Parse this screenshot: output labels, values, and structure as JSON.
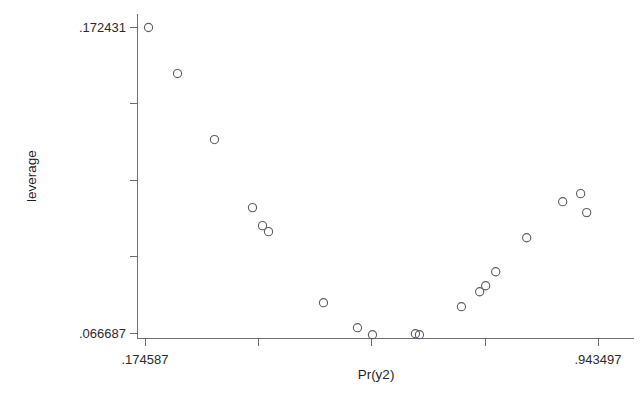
{
  "chart_data": {
    "type": "scatter",
    "title": "",
    "subtitle": "",
    "xlabel": "Pr(y2)",
    "ylabel": "leverage",
    "grid": false,
    "legend": null,
    "xlim": [
      0.174587,
      0.943497
    ],
    "ylim": [
      0.066687,
      0.172431
    ],
    "xtick_labels": [
      ".174587",
      ".943497"
    ],
    "ytick_labels": [
      ".172431",
      ".066687"
    ],
    "xticks_count": 5,
    "yticks_count": 5,
    "marker": "open-circle",
    "marker_color": "#5c5c6a",
    "n_points": 19,
    "points": [
      {
        "x": 0.1797,
        "y": 0.17243
      },
      {
        "x": 0.2289,
        "y": 0.15652
      },
      {
        "x": 0.2917,
        "y": 0.1337
      },
      {
        "x": 0.3562,
        "y": 0.11019
      },
      {
        "x": 0.3732,
        "y": 0.10396
      },
      {
        "x": 0.3834,
        "y": 0.10189
      },
      {
        "x": 0.4767,
        "y": 0.07733
      },
      {
        "x": 0.5344,
        "y": 0.06869
      },
      {
        "x": 0.5598,
        "y": 0.06628
      },
      {
        "x": 0.6328,
        "y": 0.06662
      },
      {
        "x": 0.6396,
        "y": 0.06628
      },
      {
        "x": 0.7108,
        "y": 0.07595
      },
      {
        "x": 0.7418,
        "y": 0.08112
      },
      {
        "x": 0.752,
        "y": 0.08319
      },
      {
        "x": 0.769,
        "y": 0.08803
      },
      {
        "x": 0.8216,
        "y": 0.09978
      },
      {
        "x": 0.8827,
        "y": 0.11224
      },
      {
        "x": 0.9132,
        "y": 0.11501
      },
      {
        "x": 0.9234,
        "y": 0.10846
      }
    ],
    "points_px": [
      {
        "cx": 148,
        "cy": 27
      },
      {
        "cx": 177,
        "cy": 73
      },
      {
        "cx": 214,
        "cy": 139
      },
      {
        "cx": 252,
        "cy": 207
      },
      {
        "cx": 262,
        "cy": 225
      },
      {
        "cx": 268,
        "cy": 231
      },
      {
        "cx": 323,
        "cy": 302
      },
      {
        "cx": 357,
        "cy": 327
      },
      {
        "cx": 372,
        "cy": 334
      },
      {
        "cx": 415,
        "cy": 333
      },
      {
        "cx": 419,
        "cy": 334
      },
      {
        "cx": 461,
        "cy": 306
      },
      {
        "cx": 479,
        "cy": 291
      },
      {
        "cx": 485,
        "cy": 285
      },
      {
        "cx": 495,
        "cy": 271
      },
      {
        "cx": 526,
        "cy": 237
      },
      {
        "cx": 562,
        "cy": 201
      },
      {
        "cx": 580,
        "cy": 193
      },
      {
        "cx": 586,
        "cy": 212
      }
    ]
  }
}
